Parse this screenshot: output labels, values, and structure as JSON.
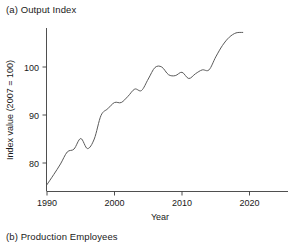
{
  "figure": {
    "panel_a_caption": "(a) Output Index",
    "panel_b_caption": "(b) Production Employees"
  },
  "chart_data": {
    "type": "line",
    "title": "(a) Output Index",
    "xlabel": "Year",
    "ylabel": "Index value (2007 = 100)",
    "xlim": [
      1988.5,
      2021.5
    ],
    "ylim": [
      74.0,
      108.5
    ],
    "xticks": [
      1990,
      2000,
      2010,
      2020
    ],
    "xtick_labels": [
      "1990",
      "2000",
      "2010",
      "2020"
    ],
    "yticks": [
      80,
      90,
      100
    ],
    "ytick_labels": [
      "80",
      "90",
      "100"
    ],
    "grid": false,
    "legend": "none",
    "line_color": "#5a5a5a",
    "series": [
      {
        "name": "Output Index (2007 = 100)",
        "x": [
          1990,
          1991,
          1992,
          1993,
          1994,
          1995,
          1996,
          1997,
          1998,
          1999,
          2000,
          2001,
          2002,
          2003,
          2004,
          2005,
          2006,
          2007,
          2008,
          2009,
          2010,
          2011,
          2012,
          2013,
          2014,
          2015,
          2016,
          2017,
          2018,
          2019
        ],
        "values": [
          75.5,
          77.6,
          79.8,
          82.3,
          82.9,
          85.1,
          83.0,
          85.0,
          89.9,
          91.3,
          92.6,
          92.6,
          93.9,
          95.4,
          95.1,
          97.5,
          99.9,
          100.0,
          98.4,
          98.2,
          98.9,
          97.6,
          98.6,
          99.4,
          99.4,
          102.1,
          104.5,
          106.2,
          107.1,
          107.2
        ]
      }
    ]
  }
}
